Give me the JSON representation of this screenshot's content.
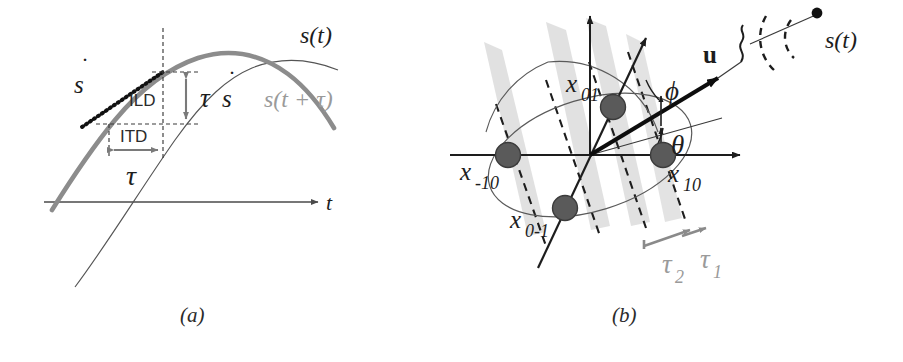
{
  "figure": {
    "panels": [
      {
        "id": "a",
        "caption": "(a)",
        "axis_label_t": "t",
        "labels": {
          "s_of_t": "s(t)",
          "s_of_t_plus_tau": "s(t + τ)",
          "sdot": "s",
          "sdot_overdot": "˙",
          "ild": "ILD",
          "itd": "ITD",
          "tau": "τ",
          "tau_sdot_tau": "τ",
          "tau_sdot_s": "s"
        },
        "colors": {
          "delayed_curve": "#8c8c8c",
          "reference_curve": "#4a4a4a",
          "tangent_dots": "#111111",
          "dimension_arrows": "#7a7a7a",
          "dashed_guides": "#3a3a3a",
          "axis": "#4a4a4a",
          "gray_text": "#9a9a9a"
        }
      },
      {
        "id": "b",
        "caption": "(b)",
        "labels": {
          "x01": "x",
          "x01_sub": "01",
          "x_minus10": "x",
          "x_minus10_sub": "-10",
          "x0_minus1": "x",
          "x0_minus1_sub": "0-1",
          "x10": "x",
          "x10_sub": "10",
          "u": "u",
          "phi": "ϕ",
          "theta": "θ",
          "tau1": "τ",
          "tau1_sub": "1",
          "tau2": "τ",
          "tau2_sub": "2",
          "source": "s(t)"
        },
        "colors": {
          "axis": "#1d1d1d",
          "sensor_dot": "#5a5a5a",
          "sensor_dot_edge": "#3b3b3b",
          "wavefront_dashed": "#1d1d1d",
          "wave_band": "#d9d9d9",
          "ellipse": "#5a5a5a",
          "arc": "#5a5a5a",
          "u_vector": "#0d0d0d",
          "tau_arrow": "#8a8a8a",
          "source_point": "#111111"
        }
      }
    ]
  }
}
